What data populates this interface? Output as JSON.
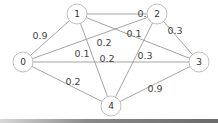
{
  "diagram": {
    "type": "weighted-undirected-graph",
    "nodes": [
      {
        "id": "0",
        "label": "0",
        "x": 23,
        "y": 62
      },
      {
        "id": "1",
        "label": "1",
        "x": 77,
        "y": 14
      },
      {
        "id": "2",
        "label": "2",
        "x": 157,
        "y": 14
      },
      {
        "id": "3",
        "label": "3",
        "x": 199,
        "y": 62
      },
      {
        "id": "4",
        "label": "4",
        "x": 111,
        "y": 106
      }
    ],
    "edges": [
      {
        "from": "0",
        "to": "1",
        "weight": "0.9",
        "lx": 40,
        "ly": 35
      },
      {
        "from": "1",
        "to": "2",
        "weight": "0.2",
        "lx": 145,
        "ly": 13
      },
      {
        "from": "2",
        "to": "3",
        "weight": "0.3",
        "lx": 175,
        "ly": 30
      },
      {
        "from": "3",
        "to": "4",
        "weight": "0.9",
        "lx": 155,
        "ly": 88
      },
      {
        "from": "0",
        "to": "4",
        "weight": "0.2",
        "lx": 73,
        "ly": 81
      },
      {
        "from": "0",
        "to": "2",
        "weight": "0.2",
        "lx": 104,
        "ly": 42
      },
      {
        "from": "0",
        "to": "3",
        "weight": "0.2",
        "lx": 107,
        "ly": 58
      },
      {
        "from": "1",
        "to": "3",
        "weight": "0.1",
        "lx": 134,
        "ly": 33
      },
      {
        "from": "1",
        "to": "4",
        "weight": "0.1",
        "lx": 82,
        "ly": 53
      },
      {
        "from": "2",
        "to": "4",
        "weight": "0.3",
        "lx": 145,
        "ly": 55
      }
    ],
    "colors": {
      "edge": "#9a9a9a",
      "node_stroke": "#b8b8b8",
      "text": "#444444"
    }
  }
}
